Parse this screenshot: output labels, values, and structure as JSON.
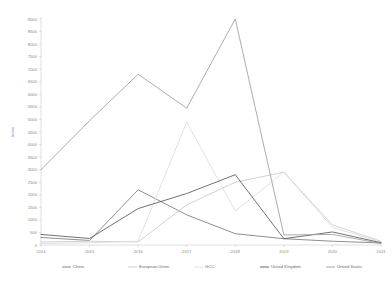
{
  "chart_data": {
    "type": "line",
    "title": "",
    "xlabel": "",
    "ylabel": "Index",
    "x": [
      2014,
      2015,
      2016,
      2017,
      2018,
      2019,
      2020,
      2021
    ],
    "xtick_labels": [
      "2014",
      "2015",
      "2016",
      "2017",
      "2018",
      "2019",
      "2020",
      "2021"
    ],
    "ylim": [
      0,
      9000
    ],
    "ytick_values": [
      0,
      500,
      1000,
      1500,
      2000,
      2500,
      3000,
      3500,
      4000,
      4500,
      5000,
      5500,
      6000,
      6500,
      7000,
      7500,
      8000,
      8500,
      9000
    ],
    "ytick_labels": [
      "0",
      "500",
      "1000",
      "1500",
      "2000",
      "2500",
      "3000",
      "3500",
      "4000",
      "4500",
      "5000",
      "5500",
      "6000",
      "6500",
      "7000",
      "7500",
      "8000",
      "8500",
      "9000"
    ],
    "grid": false,
    "legend_position": "bottom",
    "series": [
      {
        "name": "China",
        "color": "#7a7a7a",
        "values": [
          300,
          180,
          2200,
          1200,
          450,
          250,
          150,
          80
        ]
      },
      {
        "name": "European Union",
        "color": "#c9c9c9",
        "values": [
          120,
          150,
          120,
          1600,
          2500,
          2900,
          800,
          150
        ]
      },
      {
        "name": "GCC",
        "color": "#dcdcdc",
        "values": [
          60,
          90,
          150,
          4900,
          1350,
          2900,
          700,
          120
        ]
      },
      {
        "name": "United Kingdom",
        "color": "#575757",
        "values": [
          420,
          260,
          1450,
          2050,
          2800,
          250,
          520,
          90
        ]
      },
      {
        "name": "United States",
        "color": "#9e9e9e",
        "values": [
          3000,
          4950,
          6800,
          5450,
          9000,
          400,
          420,
          60
        ]
      }
    ]
  },
  "legend": {
    "entries": [
      {
        "label": "China"
      },
      {
        "label": "European Union"
      },
      {
        "label": "GCC"
      },
      {
        "label": "United Kingdom"
      },
      {
        "label": "United States"
      }
    ]
  }
}
